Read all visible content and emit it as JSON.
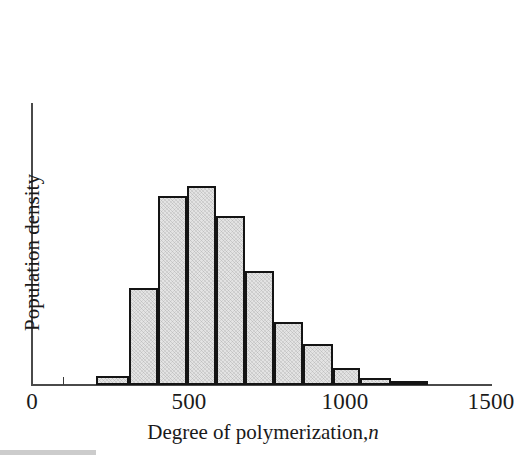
{
  "figure": {
    "background_color": "#ffffff",
    "axis_color": "#4a4a4a",
    "bar_fill_color": "#e3e3e3",
    "bar_edge_color": "#141414"
  },
  "axes": {
    "x_title_main": "Degree of polymerization,",
    "x_title_symbol": "n",
    "y_title": "Population density",
    "x_tick_labels": [
      "0",
      "500",
      "1000",
      "1500"
    ],
    "x_tick_values": [
      0,
      500,
      1000,
      1500
    ],
    "minor_tick_value": 100
  },
  "chart_data": {
    "type": "bar",
    "title": "",
    "xlabel": "Degree of polymerization, n",
    "ylabel": "Population density",
    "xlim": [
      0,
      1500
    ],
    "ylim": [
      0,
      1.0
    ],
    "grid": false,
    "legend": null,
    "bin_edges": [
      210,
      315,
      410,
      505,
      600,
      695,
      790,
      885,
      980,
      1070,
      1170,
      1290
    ],
    "categories": [
      "210-315",
      "315-410",
      "410-505",
      "505-600",
      "600-695",
      "695-790",
      "790-885",
      "885-980",
      "980-1070",
      "1070-1170",
      "1170-1290"
    ],
    "values": [
      0.032,
      0.345,
      0.67,
      0.705,
      0.6,
      0.405,
      0.225,
      0.144,
      0.06,
      0.025,
      0.011
    ],
    "bar_top_pixels": [
      376,
      288,
      196,
      186,
      216,
      271,
      322,
      345,
      369,
      378,
      382
    ],
    "baseline_pixel": 385
  }
}
